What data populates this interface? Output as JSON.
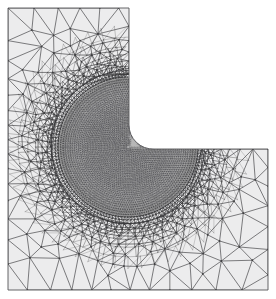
{
  "figure": {
    "kind": "finite-element-mesh",
    "title": "Adaptively refined triangular mesh on an L-shaped domain",
    "background_color": "#ffffff",
    "canvas": {
      "width": 276,
      "height": 299
    }
  },
  "chart_data": {
    "type": "diagram",
    "title": "Adaptively refined triangular mesh on an L-shaped domain",
    "subtitle": "",
    "xlabel": "",
    "ylabel": "",
    "grid": false,
    "legend": null,
    "annotations": [],
    "domain": {
      "shape": "L-shaped polygon",
      "description": "Square domain with the upper-right quadrant removed; the reentrant corner is filleted",
      "outline_points": [
        [
          8,
          8
        ],
        [
          129,
          8
        ],
        [
          129,
          126
        ],
        [
          133,
          137
        ],
        [
          143,
          146
        ],
        [
          155,
          149
        ],
        [
          268,
          149
        ],
        [
          268,
          290
        ],
        [
          8,
          290
        ]
      ],
      "fillet": {
        "center": [
          154,
          125
        ],
        "radius": 24,
        "start_angle_deg": 180,
        "end_angle_deg": 90
      },
      "bounds": {
        "x_min": 8,
        "y_min": 8,
        "x_max": 268,
        "y_max": 290
      }
    },
    "refinement_region": {
      "shape": "circle",
      "center": [
        128,
        147
      ],
      "radius": 70,
      "description": "Strongly refined zone of very small triangles concentrated around the reentrant corner singularity"
    },
    "zones": [
      {
        "name": "core",
        "label": "dense refined core",
        "radius_range": [
          0,
          66
        ],
        "appearance": "near-solid dark because element edges overlap at this scale",
        "approx_element_size_px": 2.0,
        "fill": "#3c3c3c"
      },
      {
        "name": "transition",
        "label": "graded transition band",
        "radius_range": [
          66,
          110
        ],
        "appearance": "radial fan of progressively larger triangles",
        "approx_element_size_px": 7.0,
        "fill": "#ececed"
      },
      {
        "name": "outer",
        "label": "coarse far field",
        "radius_range": [
          110,
          300
        ],
        "appearance": "unstructured coarse triangulation",
        "approx_element_size_px": 22.0,
        "fill": "#ececed"
      }
    ],
    "mesh_style": {
      "edge_color": "#555558",
      "edge_color_dense": "#3a3a3c",
      "edge_width_outer": 0.9,
      "edge_width_transition": 0.55,
      "edge_width_core": 0.35,
      "node_color": "#3a3a3c",
      "node_radius": 0.9,
      "face_fill": "#ececed",
      "background": "#ffffff"
    },
    "counts": {
      "radial_rings_core": 34,
      "radial_rings_transition": 9,
      "outer_grid_divisions": 13,
      "approx_elements": "several thousand"
    },
    "grading": {
      "law": "geometric",
      "ratio": 1.17,
      "smallest_element_px": 1.6,
      "largest_element_px": 26.0
    }
  }
}
